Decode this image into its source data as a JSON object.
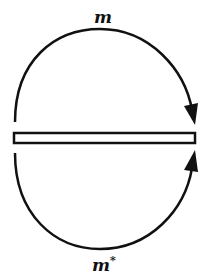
{
  "diagram": {
    "top_arrow": {
      "label": "m",
      "direction": "clockwise from left onto right end of bar"
    },
    "bottom_arrow": {
      "label": "m",
      "superscript": "*",
      "direction": "counterclockwise from left onto right end of bar"
    },
    "bar": {
      "shape": "hollow horizontal rectangle"
    },
    "colors": {
      "stroke": "#111111",
      "background": "#ffffff"
    }
  }
}
